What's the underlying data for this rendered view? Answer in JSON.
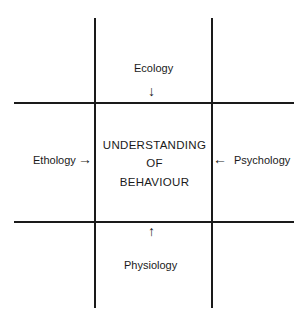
{
  "diagram": {
    "center": {
      "lines": [
        "UNDERSTANDING",
        "OF",
        "BEHAVIOUR"
      ]
    },
    "inputs": {
      "top": {
        "label": "Ecology",
        "arrow": "↓"
      },
      "bottom": {
        "label": "Physiology",
        "arrow": "↑"
      },
      "left": {
        "label": "Ethology",
        "arrow": "→"
      },
      "right": {
        "label": "Psychology",
        "arrow": "←"
      }
    }
  }
}
